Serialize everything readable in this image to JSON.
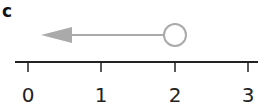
{
  "panel": {
    "label": "c"
  },
  "number_line": {
    "ticks": [
      "0",
      "1",
      "2",
      "3"
    ],
    "axis_color": "#222222"
  },
  "ray": {
    "start_value": 2,
    "start_point": "open-circle",
    "direction": "left",
    "color": "#aaaaaa"
  }
}
